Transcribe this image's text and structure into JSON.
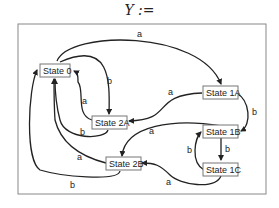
{
  "title": "Y :=",
  "diagram": {
    "type": "state-machine",
    "nodes": [
      {
        "id": "s0",
        "label": "State 0"
      },
      {
        "id": "s1a",
        "label": "State 1A"
      },
      {
        "id": "s1b",
        "label": "State 1B"
      },
      {
        "id": "s1c",
        "label": "State 1C"
      },
      {
        "id": "s2a",
        "label": "State 2A"
      },
      {
        "id": "s2b",
        "label": "State 2B"
      }
    ],
    "edges": [
      {
        "from": "State 0",
        "to": "State 1A",
        "label": "a"
      },
      {
        "from": "State 0",
        "to": "State 2A",
        "label": "b"
      },
      {
        "from": "State 2A",
        "to": "State 0",
        "label": "a"
      },
      {
        "from": "State 2A",
        "to": "State 0",
        "label": "b"
      },
      {
        "from": "State 2B",
        "to": "State 0",
        "label": "a"
      },
      {
        "from": "State 2B",
        "to": "State 0",
        "label": "b"
      },
      {
        "from": "State 1A",
        "to": "State 2A",
        "label": "a"
      },
      {
        "from": "State 1A",
        "to": "State 1B",
        "label": "b"
      },
      {
        "from": "State 1B",
        "to": "State 2B",
        "label": "a"
      },
      {
        "from": "State 1B",
        "to": "State 1C",
        "label": "b"
      },
      {
        "from": "State 1C",
        "to": "State 1B",
        "label": "b"
      },
      {
        "from": "State 1C",
        "to": "State 2B",
        "label": "a"
      }
    ]
  }
}
